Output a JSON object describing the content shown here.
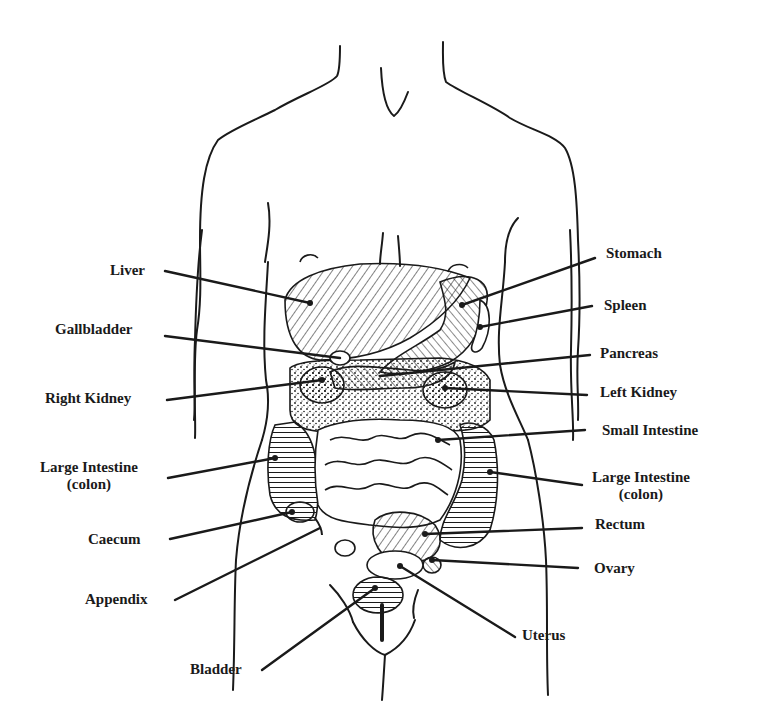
{
  "diagram": {
    "title": "",
    "colors": {
      "ink": "#1a1a1a",
      "background": "#ffffff"
    },
    "labels_left": [
      {
        "id": "liver",
        "text": "Liver"
      },
      {
        "id": "gallbladder",
        "text": "Gallbladder"
      },
      {
        "id": "right-kidney",
        "text": "Right Kidney"
      },
      {
        "id": "large-intestine-left",
        "text": "Large Intestine",
        "sub": "(colon)"
      },
      {
        "id": "caecum",
        "text": "Caecum"
      },
      {
        "id": "appendix",
        "text": "Appendix"
      },
      {
        "id": "bladder",
        "text": "Bladder"
      }
    ],
    "labels_right": [
      {
        "id": "stomach",
        "text": "Stomach"
      },
      {
        "id": "spleen",
        "text": "Spleen"
      },
      {
        "id": "pancreas",
        "text": "Pancreas"
      },
      {
        "id": "left-kidney",
        "text": "Left Kidney"
      },
      {
        "id": "small-intestine",
        "text": "Small Intestine"
      },
      {
        "id": "large-intestine-right",
        "text": "Large Intestine",
        "sub": "(colon)"
      },
      {
        "id": "rectum",
        "text": "Rectum"
      },
      {
        "id": "ovary",
        "text": "Ovary"
      },
      {
        "id": "uterus",
        "text": "Uterus"
      }
    ]
  }
}
